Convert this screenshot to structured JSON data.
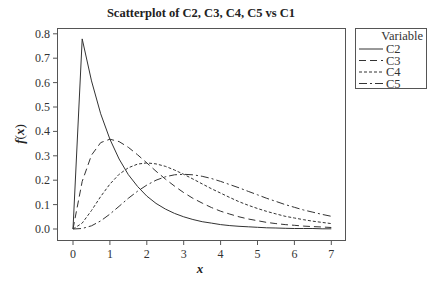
{
  "chart_data": {
    "type": "line",
    "title": "Scatterplot of C2, C3, C4, C5 vs C1",
    "xlabel": "x",
    "ylabel": "f(x)",
    "xlim": [
      -0.3,
      7.3
    ],
    "ylim": [
      -0.05,
      0.82
    ],
    "xticks": [
      0,
      1,
      2,
      3,
      4,
      5,
      6,
      7
    ],
    "yticks": [
      0.0,
      0.1,
      0.2,
      0.3,
      0.4,
      0.5,
      0.6,
      0.7,
      0.8
    ],
    "ytick_labels": [
      "0.0",
      "0.1",
      "0.2",
      "0.3",
      "0.4",
      "0.5",
      "0.6",
      "0.7",
      "0.8"
    ],
    "grid": false,
    "legend_position": "right-outside-top",
    "legend_title": "Variable",
    "x": [
      0,
      0.25,
      0.5,
      0.75,
      1,
      1.25,
      1.5,
      1.75,
      2,
      2.25,
      2.5,
      2.75,
      3,
      3.25,
      3.5,
      3.75,
      4,
      4.25,
      4.5,
      4.75,
      5,
      5.25,
      5.5,
      5.75,
      6,
      6.25,
      6.5,
      6.75,
      7
    ],
    "series": [
      {
        "name": "C2",
        "dash": "",
        "values": [
          0,
          0.779,
          0.607,
          0.472,
          0.368,
          0.287,
          0.223,
          0.174,
          0.135,
          0.105,
          0.082,
          0.064,
          0.05,
          0.039,
          0.03,
          0.024,
          0.018,
          0.014,
          0.011,
          0.009,
          0.007,
          0.005,
          0.004,
          0.003,
          0.002,
          0.002,
          0.002,
          0.001,
          0.001
        ]
      },
      {
        "name": "C3",
        "dash": "7,4",
        "values": [
          0,
          0.195,
          0.303,
          0.354,
          0.368,
          0.358,
          0.335,
          0.304,
          0.271,
          0.237,
          0.205,
          0.176,
          0.149,
          0.126,
          0.106,
          0.088,
          0.073,
          0.061,
          0.05,
          0.041,
          0.034,
          0.027,
          0.022,
          0.018,
          0.015,
          0.012,
          0.01,
          0.008,
          0.006
        ]
      },
      {
        "name": "C4",
        "dash": "3,2",
        "values": [
          0,
          0.024,
          0.076,
          0.133,
          0.184,
          0.224,
          0.251,
          0.266,
          0.271,
          0.267,
          0.257,
          0.242,
          0.224,
          0.205,
          0.185,
          0.165,
          0.147,
          0.129,
          0.112,
          0.097,
          0.084,
          0.072,
          0.062,
          0.052,
          0.045,
          0.038,
          0.032,
          0.027,
          0.022
        ]
      },
      {
        "name": "C5",
        "dash": "8,3,2,3",
        "values": [
          0,
          0.002,
          0.013,
          0.033,
          0.061,
          0.093,
          0.126,
          0.155,
          0.18,
          0.2,
          0.214,
          0.222,
          0.224,
          0.222,
          0.216,
          0.207,
          0.195,
          0.182,
          0.169,
          0.154,
          0.14,
          0.126,
          0.113,
          0.1,
          0.089,
          0.078,
          0.069,
          0.06,
          0.052
        ]
      }
    ]
  },
  "legend": {
    "title": "Variable",
    "items": [
      "C2",
      "C3",
      "C4",
      "C5"
    ]
  },
  "colors": {
    "line": "#333333",
    "frame": "#555555"
  }
}
